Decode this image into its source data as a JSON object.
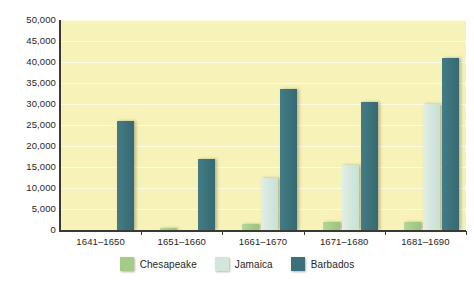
{
  "chart_data": {
    "type": "bar",
    "title": "",
    "subtitle": "",
    "xlabel": "",
    "ylabel": "",
    "ylim": [
      0,
      50000
    ],
    "y_ticks": [
      "0",
      "5,000",
      "10,000",
      "15,000",
      "20,000",
      "25,000",
      "30,000",
      "35,000",
      "40,000",
      "45,000",
      "50,000"
    ],
    "y_tick_values": [
      0,
      5000,
      10000,
      15000,
      20000,
      25000,
      30000,
      35000,
      40000,
      45000,
      50000
    ],
    "grid": true,
    "legend_position": "bottom",
    "categories": [
      "1641–1650",
      "1651–1660",
      "1661–1670",
      "1671–1680",
      "1681–1690"
    ],
    "series": [
      {
        "name": "Chesapeake",
        "color": "#a4cb88",
        "values": [
          0,
          500,
          1500,
          2000,
          2000
        ]
      },
      {
        "name": "Jamaica",
        "color": "#d2e6dc",
        "values": [
          0,
          0,
          12500,
          15500,
          30000
        ]
      },
      {
        "name": "Barbados",
        "color": "#3c717b",
        "values": [
          26000,
          17000,
          33500,
          30500,
          41000
        ]
      }
    ],
    "plot_background": "#f7f3b8",
    "gridline_color": "#fdfbe2",
    "axis_color": "#3a3a32"
  },
  "legend": {
    "items": [
      {
        "label": "Chesapeake"
      },
      {
        "label": "Jamaica"
      },
      {
        "label": "Barbados"
      }
    ]
  }
}
